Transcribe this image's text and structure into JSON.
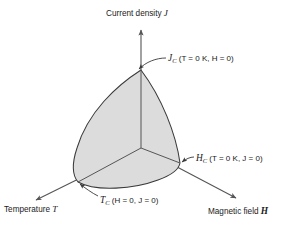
{
  "figure": {
    "type": "3d-phase-diagram",
    "axes": {
      "vertical": {
        "name": "current-density",
        "label_text": "Current density",
        "symbol": "J",
        "origin_px": [
          141,
          148
        ],
        "tip_px": [
          141,
          27
        ]
      },
      "left": {
        "name": "temperature",
        "label_text": "Temperature",
        "symbol": "T",
        "origin_px": [
          141,
          148
        ],
        "tip_px": [
          32,
          202
        ]
      },
      "right": {
        "name": "magnetic-field",
        "label_text": "Magnetic field",
        "symbol": "H",
        "origin_px": [
          141,
          148
        ],
        "tip_px": [
          240,
          200
        ]
      }
    },
    "annotations": [
      {
        "name": "jc-annotation",
        "symbol": "J",
        "subscript": "C",
        "conditions": "(T = 0 K, H = 0)",
        "full_text": "J_C (T = 0 K, H = 0)",
        "vertex_px": [
          141,
          70
        ]
      },
      {
        "name": "hc-annotation",
        "symbol": "H",
        "subscript": "C",
        "conditions": "(T = 0 K, J = 0)",
        "full_text": "H_C (T = 0 K, J = 0)",
        "vertex_px": [
          180,
          163
        ]
      },
      {
        "name": "tc-annotation",
        "symbol": "T",
        "subscript": "C",
        "conditions": "(H = 0, J = 0)",
        "full_text": "T_C (H = 0, J = 0)",
        "vertex_px": [
          78,
          182
        ]
      }
    ],
    "surface": {
      "name": "critical-surface",
      "fill_color": "#dcdcdc",
      "stroke_color": "#3a3a3a",
      "apex_px": [
        141,
        70
      ],
      "left_vertex_px": [
        78,
        182
      ],
      "right_vertex_px": [
        180,
        163
      ],
      "origin_px": [
        141,
        148
      ]
    },
    "colors": {
      "background": "#ffffff",
      "line": "#3a3a3a",
      "axis": "#555555",
      "surface_fill": "#dcdcdc",
      "text": "#1a1a1a"
    }
  },
  "labels": {
    "current_density": {
      "text": "Current density",
      "symbol": "J"
    },
    "temperature": {
      "text": "Temperature",
      "symbol": "T"
    },
    "magnetic_field": {
      "text": "Magnetic field",
      "symbol": "H"
    }
  },
  "annotations": {
    "jc": {
      "symbol": "J",
      "sub": "C",
      "conditions": "(T = 0 K, H = 0)"
    },
    "hc": {
      "symbol": "H",
      "sub": "C",
      "conditions": "(T = 0 K, J = 0)"
    },
    "tc": {
      "symbol": "T",
      "sub": "C",
      "conditions": "(H = 0, J = 0)"
    }
  }
}
